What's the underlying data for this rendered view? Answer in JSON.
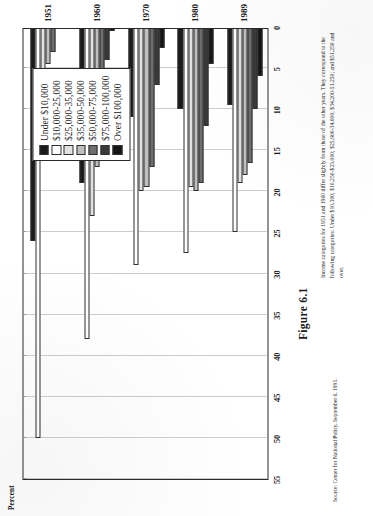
{
  "figure": {
    "caption": "Figure 6.1",
    "axis_title": "Percent",
    "note": "Income categories for 1951 and 1960 differ slightly from those of the other years. They correspond to the following categories: Under $10,300;  $10,250-$25,000;  $25,900-34,000;  $34,200-51,250;  and $51,250 and over.",
    "source": "Source: Center for National Policy, September 6, 1991."
  },
  "legend": {
    "items": [
      {
        "label": "Under $10,000",
        "color": "#1a1a1a"
      },
      {
        "label": "$10,000-25,000",
        "color": "#ffffff"
      },
      {
        "label": "$25,000-35,000",
        "color": "#e2e2e2"
      },
      {
        "label": "$35,000-50,000",
        "color": "#bfbfbf"
      },
      {
        "label": "$50,000-75,000",
        "color": "#6e6e6e"
      },
      {
        "label": "$75,000-100,000",
        "color": "#3a3a3a"
      },
      {
        "label": "Over $100,000",
        "color": "#141414"
      }
    ]
  },
  "chart_data": {
    "type": "bar",
    "title": "Figure 6.1",
    "xlabel": "",
    "ylabel": "Percent",
    "ylim": [
      0,
      55
    ],
    "yticks": [
      0,
      5,
      10,
      15,
      20,
      25,
      30,
      35,
      40,
      45,
      50,
      55
    ],
    "grid": true,
    "legend_position": "top-right",
    "orientation": "vertical-bars-rotated-page",
    "categories": [
      "1951",
      "1960",
      "1970",
      "1980",
      "1989"
    ],
    "series": [
      {
        "name": "Under $10,000",
        "color": "#1a1a1a",
        "values": [
          26.0,
          19.0,
          11.0,
          10.0,
          9.5
        ]
      },
      {
        "name": "$10,000-25,000",
        "color": "#ffffff",
        "values": [
          50.0,
          38.0,
          29.0,
          27.5,
          25.0
        ]
      },
      {
        "name": "$25,000-35,000",
        "color": "#e2e2e2",
        "values": [
          16.0,
          23.0,
          20.0,
          19.5,
          19.0
        ]
      },
      {
        "name": "$35,000-50,000",
        "color": "#bfbfbf",
        "values": [
          4.5,
          17.0,
          19.5,
          20.0,
          18.0
        ]
      },
      {
        "name": "$50,000-75,000",
        "color": "#6e6e6e",
        "values": [
          3.0,
          14.0,
          17.0,
          19.0,
          16.5
        ]
      },
      {
        "name": "$75,000-100,000",
        "color": "#3a3a3a",
        "values": [
          0.0,
          4.0,
          7.0,
          12.0,
          10.0
        ]
      },
      {
        "name": "Over $100,000",
        "color": "#141414",
        "values": [
          0.0,
          0.5,
          2.5,
          4.5,
          6.0
        ]
      }
    ]
  }
}
